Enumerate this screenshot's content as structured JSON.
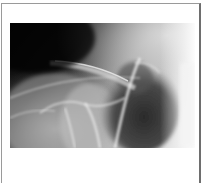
{
  "figure": {
    "type": "radiograph",
    "colors": {
      "background": "#ffffff",
      "frame_border": "#9a9a9a",
      "frame_border_right": "#6e6e6e",
      "film_dark": "#101010",
      "film_light": "#f2f2f2"
    }
  }
}
